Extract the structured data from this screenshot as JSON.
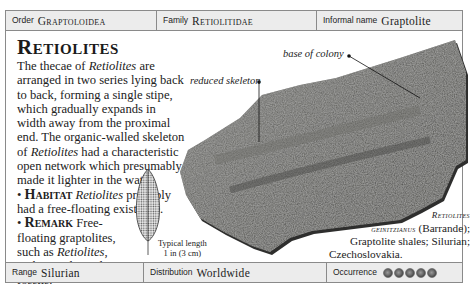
{
  "header": {
    "order": {
      "label": "Order",
      "value": "Graptoloidea"
    },
    "family": {
      "label": "Family",
      "value": "Retiolitidae"
    },
    "informal_name": {
      "label": "Informal name",
      "value": "Graptolite"
    }
  },
  "main": {
    "title": "Retiolites",
    "paragraphs": {
      "intro_pre": "The thecae of ",
      "intro_italic": "Retiolites",
      "intro_post": " are arranged in two series lying back to back, forming a single stipe, which gradually expands in width away from the proximal end. The organic-walled skeleton of ",
      "intro_italic2": "Retiolites",
      "intro_post2": " had a characteristic open network which presumably made it lighter in the water."
    },
    "habitat": {
      "bullet": "•",
      "heading": "Habitat",
      "italic": "Retiolites",
      "text": " probably had a free-floating existence."
    },
    "remark": {
      "bullet": "•",
      "heading": "Remark",
      "text_pre": " Free-floating graptolites, such as ",
      "italic": "Retiolites",
      "text_post": ", make good zonal fossils."
    }
  },
  "illustration": {
    "typical_length_line1": "Typical length",
    "typical_length_line2": "1 in (3 cm)"
  },
  "callouts": {
    "base_of_colony": "base of colony",
    "reduced_skeleton": "reduced skeleton"
  },
  "caption": {
    "species_line1": "Retiolites",
    "species_line2": "geinitzianus",
    "author": " (Barrande);",
    "line3": "Graptolite shales; Silurian;",
    "line4": "Czechoslovakia."
  },
  "footer": {
    "range": {
      "label": "Range",
      "value": "Silurian"
    },
    "distribution": {
      "label": "Distribution",
      "value": "Worldwide"
    },
    "occurrence": {
      "label": "Occurrence",
      "rating": 5,
      "max": 5
    }
  },
  "colors": {
    "bar_bg": "#ececec",
    "border": "#8a8a8a",
    "rock": "#5a5a58"
  }
}
